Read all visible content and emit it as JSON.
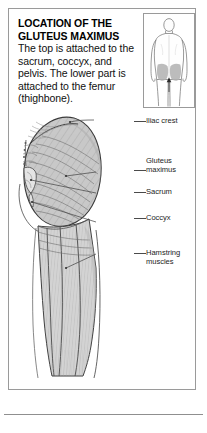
{
  "panel": {
    "caption": {
      "heading_line1": "LOCATION OF THE",
      "heading_line2": "GLUTEUS MAXIMUS",
      "body": "The top is attached to the sacrum, coccyx, and pelvis. The lower part is attached to the femur (thighbone)."
    },
    "thumbnail": {
      "alt_name": "posterior-body-diagram",
      "highlight_color": "#b0b0b0",
      "outline_color": "#6f6f6f"
    },
    "illustration": {
      "alt_name": "gluteus-maximus-anatomy",
      "muscle_fill": "#c9c9c9",
      "outline_color": "#3a3a3a",
      "labels": [
        {
          "id": "iliac-crest",
          "text": "Iliac crest"
        },
        {
          "id": "gluteus-maximus",
          "text": "Gluteus\nmaximus"
        },
        {
          "id": "sacrum",
          "text": "Sacrum"
        },
        {
          "id": "coccyx",
          "text": "Coccyx"
        },
        {
          "id": "hamstring-muscles",
          "text": "Hamstring\nmuscles"
        }
      ]
    }
  }
}
